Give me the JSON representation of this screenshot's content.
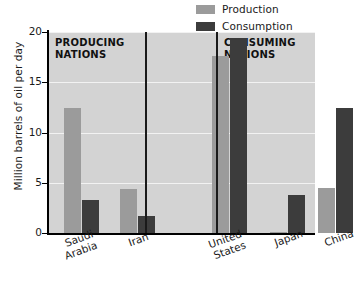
{
  "chart_data": {
    "type": "bar",
    "title": "",
    "xlabel": "",
    "ylabel": "Million barrels of oil per day",
    "ylim": [
      0,
      20
    ],
    "yticks": [
      0,
      5,
      10,
      15,
      20
    ],
    "grid": true,
    "legend_position": "top-right",
    "categories": [
      "Saudi Arabia",
      "Iran",
      "United States",
      "Japan",
      "China"
    ],
    "series": [
      {
        "name": "Production",
        "color": "#9b9b9b",
        "values": [
          12.4,
          4.4,
          17.6,
          0.1,
          4.5
        ]
      },
      {
        "name": "Consumption",
        "color": "#3c3c3c",
        "values": [
          3.3,
          1.7,
          19.4,
          3.8,
          12.4
        ]
      }
    ],
    "annotations": [
      {
        "text": "PRODUCING\nNATIONS",
        "group": [
          "Saudi Arabia",
          "Iran"
        ]
      },
      {
        "text": "CONSUMING\nNATIONS",
        "group": [
          "Japan",
          "China"
        ]
      }
    ],
    "separators": [
      "after Iran",
      "after United States"
    ]
  },
  "legend": {
    "items": [
      {
        "label": "Production",
        "color": "#9b9b9b"
      },
      {
        "label": "Consumption",
        "color": "#3c3c3c"
      }
    ]
  },
  "axes": {
    "y_title": "Million barrels of oil per day",
    "y_tick_labels": [
      "20",
      "15",
      "10",
      "5",
      "0"
    ],
    "x_tick_labels": [
      "Saudi\nArabia",
      "Iran",
      "United\nStates",
      "Japan",
      "China"
    ]
  },
  "sections": {
    "left_header": "PRODUCING\nNATIONS",
    "right_header": "CONSUMING\nNATIONS"
  },
  "colors": {
    "plot_background": "#d3d3d3",
    "gridline": "#f2f2f2",
    "axis": "#000000",
    "production": "#9b9b9b",
    "consumption": "#3c3c3c"
  }
}
